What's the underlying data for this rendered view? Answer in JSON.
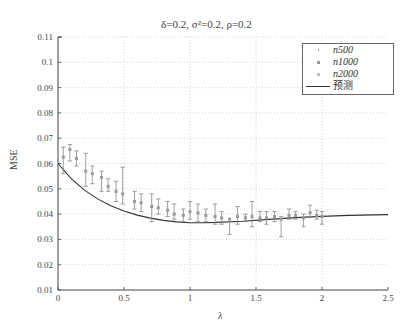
{
  "chart_data": {
    "type": "scatter",
    "title": "δ=0.2,  σ²=0.2,  ρ=0.2",
    "xlabel": "λ",
    "ylabel": "MSE",
    "xlim": [
      0,
      2.5
    ],
    "ylim": [
      0.01,
      0.11
    ],
    "xticks": [
      "0",
      "0.5",
      "1",
      "1.5",
      "2",
      "2.5"
    ],
    "yticks": [
      "0.01",
      "0.02",
      "0.03",
      "0.04",
      "0.05",
      "0.06",
      "0.07",
      "0.08",
      "0.09",
      "0.1",
      "0.11"
    ],
    "grid": true,
    "legend_position": "upper right",
    "legend": [
      "n500",
      "n1000",
      "n2000",
      "预测"
    ],
    "series": [
      {
        "name": "n500/n1000/n2000 (simulated, with error bars)",
        "points": [
          {
            "x": 0.04,
            "y": 0.0625,
            "lo": 0.056,
            "hi": 0.0665
          },
          {
            "x": 0.09,
            "y": 0.0655,
            "lo": 0.061,
            "hi": 0.0675
          },
          {
            "x": 0.14,
            "y": 0.062,
            "lo": 0.059,
            "hi": 0.065
          },
          {
            "x": 0.21,
            "y": 0.057,
            "lo": 0.051,
            "hi": 0.064
          },
          {
            "x": 0.26,
            "y": 0.056,
            "lo": 0.052,
            "hi": 0.059
          },
          {
            "x": 0.33,
            "y": 0.0545,
            "lo": 0.049,
            "hi": 0.057
          },
          {
            "x": 0.38,
            "y": 0.051,
            "lo": 0.049,
            "hi": 0.054
          },
          {
            "x": 0.44,
            "y": 0.049,
            "lo": 0.045,
            "hi": 0.053
          },
          {
            "x": 0.49,
            "y": 0.048,
            "lo": 0.044,
            "hi": 0.0585
          },
          {
            "x": 0.58,
            "y": 0.045,
            "lo": 0.042,
            "hi": 0.049
          },
          {
            "x": 0.63,
            "y": 0.0445,
            "lo": 0.041,
            "hi": 0.048
          },
          {
            "x": 0.71,
            "y": 0.043,
            "lo": 0.037,
            "hi": 0.048
          },
          {
            "x": 0.76,
            "y": 0.0425,
            "lo": 0.04,
            "hi": 0.046
          },
          {
            "x": 0.83,
            "y": 0.0415,
            "lo": 0.039,
            "hi": 0.045
          },
          {
            "x": 0.88,
            "y": 0.04,
            "lo": 0.038,
            "hi": 0.044
          },
          {
            "x": 0.95,
            "y": 0.0395,
            "lo": 0.037,
            "hi": 0.042
          },
          {
            "x": 1.0,
            "y": 0.041,
            "lo": 0.038,
            "hi": 0.045
          },
          {
            "x": 1.06,
            "y": 0.0405,
            "lo": 0.037,
            "hi": 0.044
          },
          {
            "x": 1.12,
            "y": 0.0395,
            "lo": 0.037,
            "hi": 0.042
          },
          {
            "x": 1.19,
            "y": 0.039,
            "lo": 0.036,
            "hi": 0.044
          },
          {
            "x": 1.24,
            "y": 0.0385,
            "lo": 0.036,
            "hi": 0.041
          },
          {
            "x": 1.3,
            "y": 0.038,
            "lo": 0.032,
            "hi": 0.037
          },
          {
            "x": 1.36,
            "y": 0.039,
            "lo": 0.036,
            "hi": 0.043
          },
          {
            "x": 1.42,
            "y": 0.0385,
            "lo": 0.037,
            "hi": 0.04
          },
          {
            "x": 1.47,
            "y": 0.039,
            "lo": 0.035,
            "hi": 0.045
          },
          {
            "x": 1.53,
            "y": 0.0385,
            "lo": 0.037,
            "hi": 0.041
          },
          {
            "x": 1.58,
            "y": 0.0385,
            "lo": 0.036,
            "hi": 0.041
          },
          {
            "x": 1.64,
            "y": 0.039,
            "lo": 0.037,
            "hi": 0.041
          },
          {
            "x": 1.69,
            "y": 0.038,
            "lo": 0.031,
            "hi": 0.039
          },
          {
            "x": 1.75,
            "y": 0.0395,
            "lo": 0.038,
            "hi": 0.042
          },
          {
            "x": 1.8,
            "y": 0.0395,
            "lo": 0.038,
            "hi": 0.041
          },
          {
            "x": 1.86,
            "y": 0.0385,
            "lo": 0.035,
            "hi": 0.04
          },
          {
            "x": 1.91,
            "y": 0.0405,
            "lo": 0.039,
            "hi": 0.0435
          },
          {
            "x": 1.96,
            "y": 0.0395,
            "lo": 0.038,
            "hi": 0.0415
          },
          {
            "x": 2.0,
            "y": 0.039,
            "lo": 0.036,
            "hi": 0.041
          }
        ]
      },
      {
        "name": "预测",
        "type": "line",
        "x": [
          0,
          0.1,
          0.2,
          0.3,
          0.4,
          0.5,
          0.6,
          0.7,
          0.8,
          0.9,
          1.0,
          1.1,
          1.2,
          1.4,
          1.6,
          1.8,
          2.0,
          2.2,
          2.5
        ],
        "y": [
          0.06,
          0.054,
          0.0495,
          0.046,
          0.0433,
          0.0412,
          0.0396,
          0.0384,
          0.0375,
          0.0369,
          0.0366,
          0.0366,
          0.0367,
          0.0372,
          0.0379,
          0.0386,
          0.0391,
          0.0395,
          0.0398
        ]
      }
    ]
  },
  "axes": {
    "plot_left": 58,
    "plot_right": 388,
    "plot_top": 37,
    "plot_bottom": 290
  }
}
